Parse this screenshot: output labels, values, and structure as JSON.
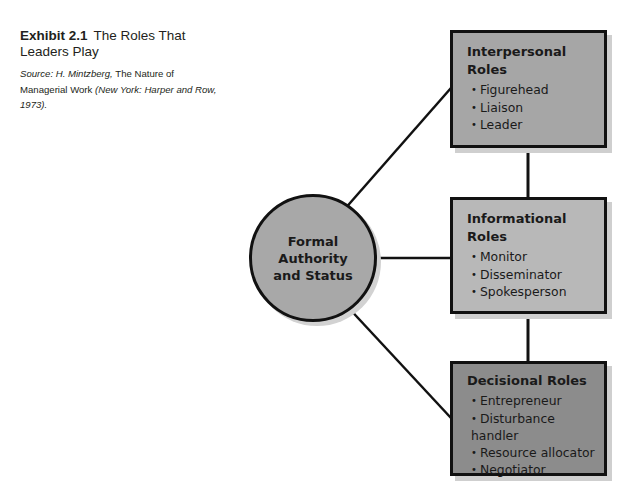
{
  "exhibit": {
    "number": "Exhibit 2.1",
    "title": "The Roles That Leaders Play",
    "source_prefix": "Source: H. Mintzberg,",
    "source_book": "The Nature of Managerial Work",
    "source_suffix": "(New York: Harper and Row, 1973)."
  },
  "diagram": {
    "center": {
      "label": "Formal Authority and Status",
      "fill": "#a8a8a8"
    },
    "bullet": "•",
    "role_groups": [
      {
        "title": "Interpersonal Roles",
        "fill": "#a6a6a6",
        "items": [
          "Figurehead",
          "Liaison",
          "Leader"
        ]
      },
      {
        "title": "Informational Roles",
        "fill": "#b8b8b8",
        "items": [
          "Monitor",
          "Disseminator",
          "Spokesperson"
        ]
      },
      {
        "title": "Decisional Roles",
        "fill": "#8c8c8c",
        "items": [
          "Entrepreneur",
          "Disturbance handler",
          "Resource allocator",
          "Negotiator"
        ]
      }
    ],
    "line_color": "#111111"
  }
}
